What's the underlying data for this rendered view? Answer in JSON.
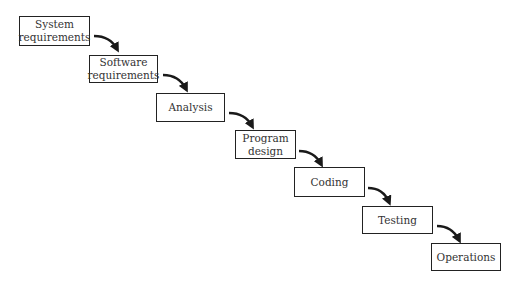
{
  "diagram": {
    "type": "waterfall-model",
    "colors": {
      "border": "#222222",
      "text": "#333333",
      "arrow": "#1a1a1a",
      "background": "#ffffff"
    },
    "stages": [
      {
        "id": "system-requirements",
        "label": "System\nrequirements",
        "box": {
          "x": 19,
          "y": 16,
          "w": 71,
          "h": 30
        }
      },
      {
        "id": "software-requirements",
        "label": "Software\nrequirements",
        "box": {
          "x": 89,
          "y": 55,
          "w": 69,
          "h": 28
        }
      },
      {
        "id": "analysis",
        "label": "Analysis",
        "box": {
          "x": 156,
          "y": 93,
          "w": 69,
          "h": 29
        }
      },
      {
        "id": "program-design",
        "label": "Program\ndesign",
        "box": {
          "x": 235,
          "y": 130,
          "w": 61,
          "h": 29
        }
      },
      {
        "id": "coding",
        "label": "Coding",
        "box": {
          "x": 294,
          "y": 167,
          "w": 71,
          "h": 30
        }
      },
      {
        "id": "testing",
        "label": "Testing",
        "box": {
          "x": 362,
          "y": 206,
          "w": 71,
          "h": 28
        }
      },
      {
        "id": "operations",
        "label": "Operations",
        "box": {
          "x": 431,
          "y": 243,
          "w": 70,
          "h": 28
        }
      }
    ],
    "arrows": [
      {
        "from": "system-requirements",
        "to": "software-requirements",
        "path": "M94 36 Q110 36 117 49"
      },
      {
        "from": "software-requirements",
        "to": "analysis",
        "path": "M163 75 Q179 75 186 89"
      },
      {
        "from": "analysis",
        "to": "program-design",
        "path": "M229 113 Q245 113 252 126"
      },
      {
        "from": "program-design",
        "to": "coding",
        "path": "M299 151 Q314 151 321 164"
      },
      {
        "from": "coding",
        "to": "testing",
        "path": "M368 188 Q383 188 389 202"
      },
      {
        "from": "testing",
        "to": "operations",
        "path": "M437 226 Q452 226 459 240"
      }
    ]
  }
}
